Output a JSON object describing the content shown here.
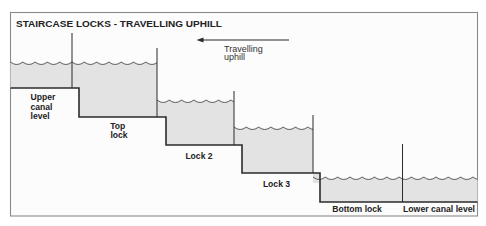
{
  "diagram": {
    "title": "STAIRCASE LOCKS - TRAVELLING UPHILL",
    "direction": {
      "arrow_icon": "left-arrow-icon",
      "line1": "Travelling",
      "line2": "uphill"
    },
    "sections": [
      {
        "name": "Upper canal level",
        "lines": [
          "Upper",
          "canal",
          "level"
        ]
      },
      {
        "name": "Top lock",
        "lines": [
          "Top",
          "lock"
        ]
      },
      {
        "name": "Lock 2",
        "lines": [
          "Lock 2"
        ]
      },
      {
        "name": "Lock 3",
        "lines": [
          "Lock 3"
        ]
      },
      {
        "name": "Bottom lock",
        "lines": [
          "Bottom lock"
        ]
      },
      {
        "name": "Lower canal level",
        "lines": [
          "Lower canal level"
        ]
      }
    ],
    "gate_count": 5
  },
  "colors": {
    "bg": "#ffffff",
    "panel": "#fcfcfc",
    "water": "#e3e3e3",
    "line": "#2b2b2b",
    "wave": "#4a4a4a",
    "frame": "#8a8a8a",
    "text": "#222222"
  }
}
